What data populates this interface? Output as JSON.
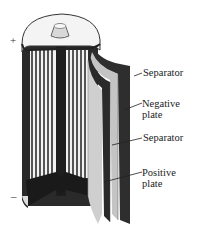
{
  "diagram": {
    "terminals": {
      "positive": "+",
      "negative": "–"
    },
    "labels": [
      {
        "id": "separator-top",
        "lines": [
          "Separator"
        ]
      },
      {
        "id": "negative-plate",
        "lines": [
          "Negative",
          "plate"
        ]
      },
      {
        "id": "separator-bottom",
        "lines": [
          "Separator"
        ]
      },
      {
        "id": "positive-plate",
        "lines": [
          "Positive",
          "plate"
        ]
      }
    ],
    "colors": {
      "dark": "#2a2a2a",
      "mid": "#8a8a8a",
      "light": "#c8c8c8",
      "pale": "#e8e8e8",
      "background": "#ffffff"
    }
  }
}
